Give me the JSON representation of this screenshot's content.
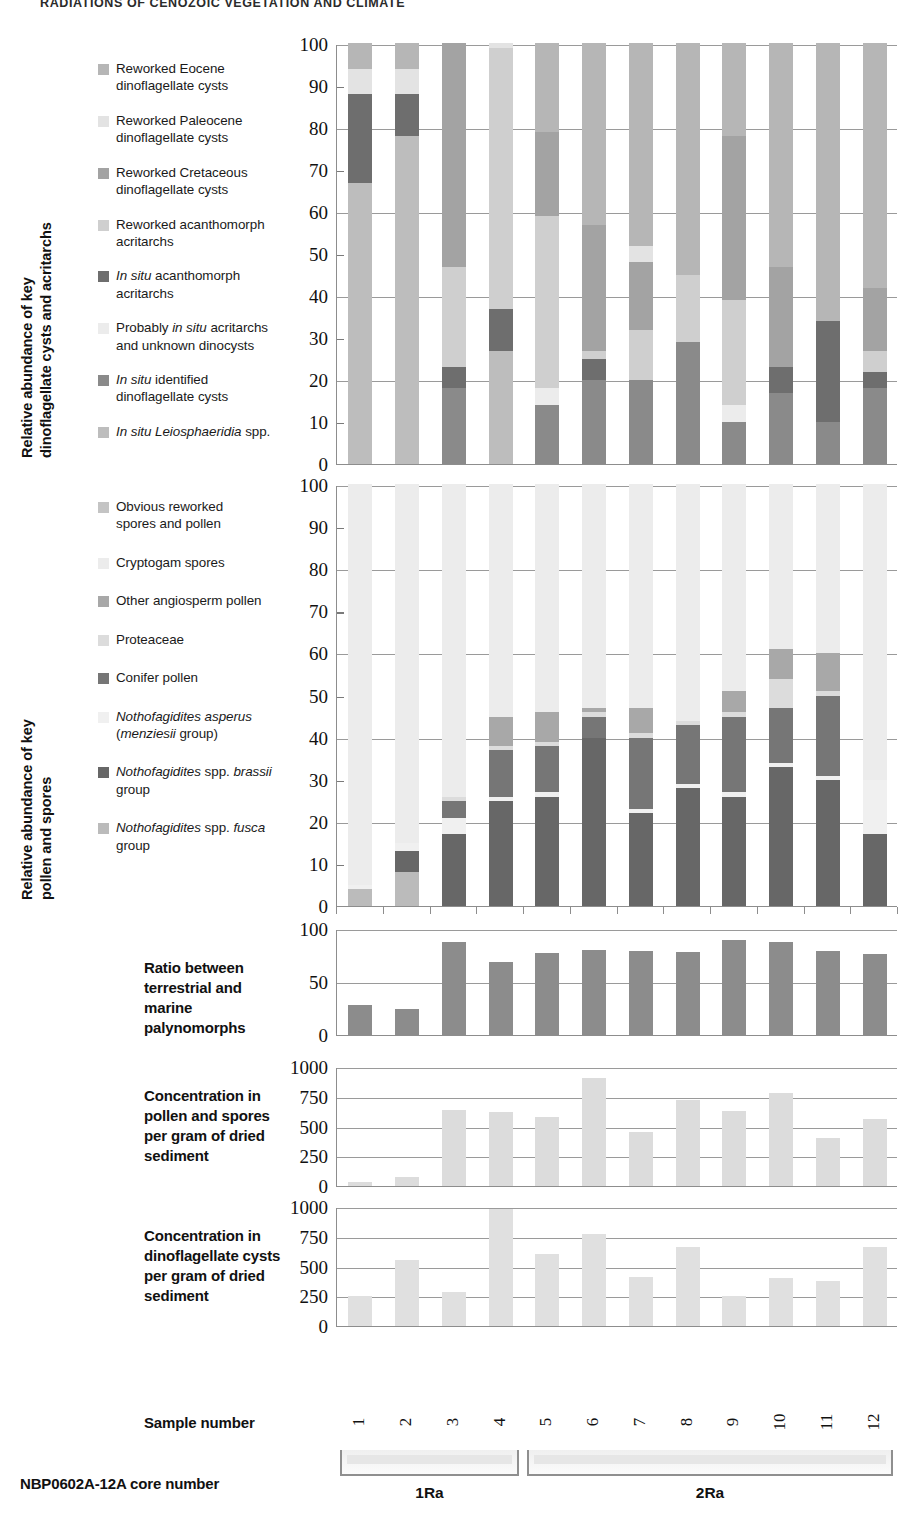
{
  "running_head": "RADIATIONS OF CENOZOIC VEGETATION AND CLIMATE",
  "axis_titles": {
    "chart1": "Relative abundance of key\ndinoflagellate cysts and acritarchs",
    "chart1_line1": "Relative abundance of key",
    "chart1_line2": "dinoflagellate cysts and acritarchs",
    "chart2_line1": "Relative abundance of key",
    "chart2_line2": "pollen and spores"
  },
  "captions": {
    "ratio": "Ratio between\nterrestrial and\nmarine\npalynomorphs",
    "pollen_conc": "Concentration in\npollen and spores\nper gram of dried\nsediment",
    "dino_conc": "Concentration in\ndinoflagellate cysts\nper gram of dried\nsediment",
    "sample_number": "Sample number",
    "core_number": "NBP0602A-12A core number"
  },
  "colors": {
    "reworked_eocene": "#b6b6b6",
    "reworked_paleocene": "#e3e3e3",
    "reworked_cretaceous": "#a3a3a3",
    "reworked_acanthomorph": "#cfcfcf",
    "insitu_acanthomorph": "#6e6e6e",
    "probably_insitu": "#ececec",
    "insitu_identified": "#8a8a8a",
    "insitu_leiosphaeridia": "#bdbdbd",
    "obvious_reworked": "#c4c4c4",
    "cryptogam": "#ececec",
    "other_angiosperm": "#a8a8a8",
    "proteaceae": "#dcdcdc",
    "conifer": "#767676",
    "notho_asperus": "#f0f0f0",
    "notho_brassii": "#676767",
    "notho_fusca": "#bbbbbb",
    "ratio_bar": "#8c8c8c",
    "pollen_conc_bar": "#dcdcdc",
    "dino_conc_bar": "#e0e0e0",
    "gridline": "#9a9a9a",
    "axis": "#8d8d8d"
  },
  "legend1": {
    "items": [
      {
        "label": "Reworked Eocene dinoflagellate cysts",
        "key": "reworked_eocene",
        "lines": [
          "Reworked Eocene",
          "dinoflagellate cysts"
        ]
      },
      {
        "label": "Reworked Paleocene dinoflagellate cysts",
        "key": "reworked_paleocene",
        "lines": [
          "Reworked Paleocene",
          "dinoflagellate cysts"
        ]
      },
      {
        "label": "Reworked Cretaceous dinoflagellate cysts",
        "key": "reworked_cretaceous",
        "lines": [
          "Reworked Cretaceous",
          "dinoflagellate cysts"
        ]
      },
      {
        "label": "Reworked acanthomorph acritarchs",
        "key": "reworked_acanthomorph",
        "lines": [
          "Reworked acanthomorph",
          "acritarchs"
        ]
      },
      {
        "label": "In situ acanthomorph acritarchs",
        "key": "insitu_acanthomorph",
        "lines": [
          "In situ acanthomorph",
          "acritarchs"
        ]
      },
      {
        "label": "Probably in situ acritarchs and unknown dinocysts",
        "key": "probably_insitu",
        "lines": [
          "Probably in situ acritarchs",
          "and unknown dinocysts"
        ]
      },
      {
        "label": "In situ identified dinoflagellate cysts",
        "key": "insitu_identified",
        "lines": [
          "In situ identified",
          "dinoflagellate cysts"
        ]
      },
      {
        "label": "In situ Leiosphaeridia spp.",
        "key": "insitu_leiosphaeridia",
        "lines": [
          "In situ Leiosphaeridia spp."
        ]
      }
    ]
  },
  "legend2": {
    "items": [
      {
        "label": "Obvious reworked spores and pollen",
        "key": "obvious_reworked",
        "lines": [
          "Obvious reworked",
          " spores and pollen"
        ]
      },
      {
        "label": "Cryptogam spores",
        "key": "cryptogam",
        "lines": [
          "Cryptogam spores"
        ]
      },
      {
        "label": "Other angiosperm pollen",
        "key": "other_angiosperm",
        "lines": [
          "Other angiosperm pollen"
        ]
      },
      {
        "label": "Proteaceae",
        "key": "proteaceae",
        "lines": [
          "Proteaceae"
        ]
      },
      {
        "label": "Conifer pollen",
        "key": "conifer",
        "lines": [
          "Conifer pollen"
        ]
      },
      {
        "label": "Nothofagidites asperus (menziesii group)",
        "key": "notho_asperus",
        "lines": [
          "Nothofagidites asperus",
          "(menziesii group)"
        ]
      },
      {
        "label": "Nothofagidites spp. brassii group",
        "key": "notho_brassii",
        "lines": [
          "Nothofagidites spp. brassii",
          "group"
        ]
      },
      {
        "label": "Nothofagidites spp. fusca group",
        "key": "notho_fusca",
        "lines": [
          "Nothofagidites  spp. fusca",
          "group"
        ]
      }
    ]
  },
  "samples": [
    "1",
    "2",
    "3",
    "4",
    "5",
    "6",
    "7",
    "8",
    "9",
    "10",
    "11",
    "12"
  ],
  "cores": [
    {
      "name": "1Ra",
      "first": 1,
      "last": 4
    },
    {
      "name": "2Ra",
      "first": 5,
      "last": 12
    }
  ],
  "chart_data": [
    {
      "type": "bar",
      "id": "marine-palynomorphs",
      "stacked": true,
      "title": "Relative abundance of key dinoflagellate cysts and acritarchs",
      "xlabel": "Sample number",
      "ylabel": "Relative abundance of key dinoflagellate cysts and acritarchs",
      "ylim": [
        0,
        100
      ],
      "yticks": [
        0,
        10,
        20,
        30,
        40,
        50,
        60,
        70,
        80,
        90,
        100
      ],
      "grid": true,
      "categories": [
        "1",
        "2",
        "3",
        "4",
        "5",
        "6",
        "7",
        "8",
        "9",
        "10",
        "11",
        "12"
      ],
      "series": [
        {
          "name": "In situ Leiosphaeridia spp.",
          "key": "insitu_leiosphaeridia",
          "values": [
            67,
            78,
            0,
            27,
            0,
            0,
            0,
            0,
            0,
            0,
            0,
            0
          ]
        },
        {
          "name": "In situ identified dinoflagellate cysts",
          "key": "insitu_identified",
          "values": [
            0,
            0,
            18,
            0,
            14,
            20,
            20,
            29,
            10,
            17,
            10,
            18
          ]
        },
        {
          "name": "Probably in situ acritarchs and unknown dinocysts",
          "key": "probably_insitu",
          "values": [
            0,
            0,
            0,
            0,
            4,
            0,
            0,
            0,
            4,
            0,
            0,
            0
          ]
        },
        {
          "name": "In situ acanthomorph acritarchs",
          "key": "insitu_acanthomorph",
          "values": [
            21,
            10,
            5,
            10,
            0,
            5,
            0,
            0,
            0,
            6,
            24,
            4
          ]
        },
        {
          "name": "Reworked acanthomorph acritarchs",
          "key": "reworked_acanthomorph",
          "values": [
            0,
            0,
            24,
            62,
            41,
            2,
            12,
            16,
            25,
            0,
            0,
            5
          ]
        },
        {
          "name": "Reworked Cretaceous dinoflagellate cysts",
          "key": "reworked_cretaceous",
          "values": [
            0,
            0,
            53,
            0,
            20,
            30,
            16,
            0,
            39,
            24,
            0,
            15
          ]
        },
        {
          "name": "Reworked Paleocene dinoflagellate cysts",
          "key": "reworked_paleocene",
          "values": [
            6,
            6,
            0,
            1,
            0,
            0,
            4,
            0,
            0,
            0,
            0,
            0
          ]
        },
        {
          "name": "Reworked Eocene dinoflagellate cysts",
          "key": "reworked_eocene",
          "values": [
            6,
            6,
            0,
            0,
            21,
            43,
            48,
            55,
            22,
            53,
            66,
            58
          ]
        }
      ]
    },
    {
      "type": "bar",
      "id": "terrestrial-palynomorphs",
      "stacked": true,
      "title": "Relative abundance of key pollen and spores",
      "xlabel": "Sample number",
      "ylabel": "Relative abundance of key pollen and spores",
      "ylim": [
        0,
        100
      ],
      "yticks": [
        0,
        10,
        20,
        30,
        40,
        50,
        60,
        70,
        80,
        90,
        100
      ],
      "grid": true,
      "categories": [
        "1",
        "2",
        "3",
        "4",
        "5",
        "6",
        "7",
        "8",
        "9",
        "10",
        "11",
        "12"
      ],
      "series": [
        {
          "name": "Nothofagidites spp. fusca group",
          "key": "notho_fusca",
          "values": [
            4,
            8,
            0,
            0,
            0,
            0,
            0,
            0,
            0,
            0,
            0,
            0
          ]
        },
        {
          "name": "Nothofagidites spp. brassii group",
          "key": "notho_brassii",
          "values": [
            0,
            5,
            17,
            25,
            26,
            40,
            22,
            28,
            26,
            33,
            30,
            17
          ]
        },
        {
          "name": "Nothofagidites asperus (menziesii group)",
          "key": "notho_asperus",
          "values": [
            1,
            2,
            4,
            1,
            1,
            0,
            1,
            1,
            1,
            1,
            1,
            13
          ]
        },
        {
          "name": "Conifer pollen",
          "key": "conifer",
          "values": [
            0,
            0,
            4,
            11,
            11,
            5,
            17,
            14,
            18,
            13,
            19,
            0
          ]
        },
        {
          "name": "Proteaceae",
          "key": "proteaceae",
          "values": [
            0,
            0,
            1,
            1,
            1,
            1,
            1,
            1,
            1,
            7,
            1,
            0
          ]
        },
        {
          "name": "Other angiosperm pollen",
          "key": "other_angiosperm",
          "values": [
            0,
            0,
            0,
            7,
            7,
            1,
            6,
            0,
            5,
            7,
            9,
            0
          ]
        },
        {
          "name": "Cryptogam spores",
          "key": "cryptogam",
          "values": [
            95,
            85,
            74,
            55,
            54,
            53,
            53,
            56,
            49,
            39,
            40,
            70
          ]
        },
        {
          "name": "Obvious reworked spores and pollen",
          "key": "obvious_reworked",
          "values": [
            0,
            0,
            0,
            0,
            0,
            0,
            0,
            0,
            0,
            0,
            0,
            0
          ]
        }
      ]
    },
    {
      "type": "bar",
      "id": "terrestrial-marine-ratio",
      "stacked": false,
      "title": "Ratio between terrestrial and marine palynomorphs",
      "xlabel": "Sample number",
      "ylabel": "Ratio between terrestrial and marine palynomorphs",
      "ylim": [
        0,
        100
      ],
      "yticks": [
        0,
        50,
        100
      ],
      "grid": true,
      "categories": [
        "1",
        "2",
        "3",
        "4",
        "5",
        "6",
        "7",
        "8",
        "9",
        "10",
        "11",
        "12"
      ],
      "values": [
        28,
        25,
        88,
        69,
        77,
        80,
        79,
        78,
        90,
        88,
        79,
        76
      ],
      "color_key": "ratio_bar"
    },
    {
      "type": "bar",
      "id": "pollen-spore-concentration",
      "stacked": false,
      "title": "Concentration in pollen and spores per gram of dried sediment",
      "xlabel": "Sample number",
      "ylabel": "Concentration in pollen and spores per gram of dried sediment",
      "ylim": [
        0,
        1000
      ],
      "yticks": [
        0,
        250,
        500,
        750,
        1000
      ],
      "grid": true,
      "categories": [
        "1",
        "2",
        "3",
        "4",
        "5",
        "6",
        "7",
        "8",
        "9",
        "10",
        "11",
        "12"
      ],
      "values": [
        30,
        75,
        635,
        620,
        580,
        905,
        455,
        725,
        630,
        780,
        405,
        565
      ],
      "color_key": "pollen_conc_bar"
    },
    {
      "type": "bar",
      "id": "dinocyst-concentration",
      "stacked": false,
      "title": "Concentration in dinoflagellate cysts per gram of dried sediment",
      "xlabel": "Sample number",
      "ylabel": "Concentration in dinoflagellate cysts per gram of dried sediment",
      "ylim": [
        0,
        1000
      ],
      "yticks": [
        0,
        250,
        500,
        750,
        1000
      ],
      "grid": true,
      "categories": [
        "1",
        "2",
        "3",
        "4",
        "5",
        "6",
        "7",
        "8",
        "9",
        "10",
        "11",
        "12"
      ],
      "values": [
        250,
        555,
        285,
        980,
        605,
        770,
        410,
        665,
        250,
        405,
        375,
        665
      ],
      "color_key": "dino_conc_bar"
    }
  ]
}
